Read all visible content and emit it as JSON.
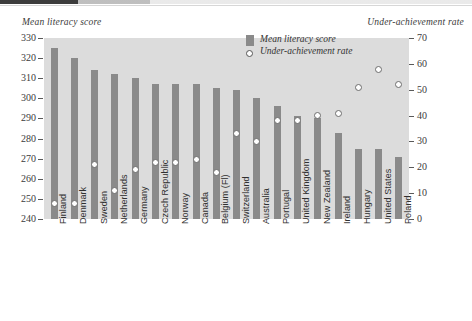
{
  "chart_data": {
    "type": "bar",
    "title": "",
    "categories": [
      "Finland",
      "Denmark",
      "Sweden",
      "Netherlands",
      "Germany",
      "Czech Republic",
      "Norway",
      "Canada",
      "Belgium (Fl)",
      "Switzerland",
      "Australia",
      "Portugal",
      "United Kingdom",
      "New Zealand",
      "Ireland",
      "Hungary",
      "United States",
      "Poland"
    ],
    "series": [
      {
        "name": "Mean literacy score",
        "type": "bar",
        "axis": "left",
        "values": [
          325,
          320,
          314,
          312,
          310,
          307,
          307,
          307,
          305,
          304,
          300,
          296,
          291,
          290,
          283,
          275,
          275,
          271
        ]
      },
      {
        "name": "Under-achievement rate",
        "type": "scatter",
        "axis": "right",
        "values": [
          6,
          6,
          21,
          11,
          19,
          22,
          22,
          23,
          18,
          33,
          30,
          38,
          38,
          40,
          41,
          51,
          58,
          52
        ]
      }
    ],
    "ylabel": "Mean literacy score",
    "y2label": "Under-achievement rate",
    "xlabel": "",
    "ylim": [
      240,
      330
    ],
    "yticks": [
      240,
      250,
      260,
      270,
      280,
      290,
      300,
      310,
      320,
      330
    ],
    "y2lim": [
      0,
      70
    ],
    "y2ticks": [
      0,
      10,
      20,
      30,
      40,
      50,
      60,
      70
    ],
    "grid": false,
    "legend_position": "top-center",
    "legend": [
      "Mean literacy score",
      "Under-achievement rate"
    ],
    "colors": {
      "bar": "#8a8a8a",
      "marker_fill": "#ffffff",
      "marker_edge": "#6d6d6d",
      "plot_background": "#dcdcdc",
      "page_background": "#ffffff",
      "text": "#333333"
    }
  },
  "axes": {
    "left_title": "Mean literacy score",
    "right_title": "Under-achievement rate"
  },
  "legend": {
    "items": [
      {
        "label": "Mean literacy score",
        "marker": "bar-swatch-icon"
      },
      {
        "label": "Under-achievement rate",
        "marker": "circle-marker-icon"
      }
    ]
  }
}
